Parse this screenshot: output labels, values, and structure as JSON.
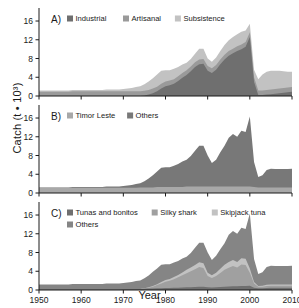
{
  "figure": {
    "axis": {
      "ylabel": "Catch (t • 10³)",
      "xlabel": "Year",
      "yticks": [
        0,
        4,
        8,
        12,
        16
      ],
      "xticks": [
        1950,
        1960,
        1970,
        1980,
        1990,
        2000,
        2010
      ],
      "ylim": [
        0,
        17.5
      ],
      "xlim": [
        1950,
        2010
      ]
    },
    "colors": {
      "dark": "#6f6f6f",
      "mid": "#8f8f8f",
      "light": "#b4b4b4",
      "lighter": "#c9c9c9",
      "axis": "#1a1a1a",
      "background": "#ffffff"
    },
    "panels": [
      {
        "id": "A)",
        "legend": [
          {
            "label": "Industrial",
            "color": "#6f6f6f"
          },
          {
            "label": "Artisanal",
            "color": "#9a9a9a"
          },
          {
            "label": "Subsistence",
            "color": "#c2c2c2"
          }
        ]
      },
      {
        "id": "B)",
        "legend": [
          {
            "label": "Timor Leste",
            "color": "#a8a8a8"
          },
          {
            "label": "Others",
            "color": "#787878"
          }
        ]
      },
      {
        "id": "C)",
        "legend": [
          {
            "label": "Tunas and bonitos",
            "color": "#6f6f6f"
          },
          {
            "label": "Silky shark",
            "color": "#a0a0a0"
          },
          {
            "label": "Skipjack tuna",
            "color": "#c2c2c2"
          },
          {
            "label": "Others",
            "color": "#858585"
          }
        ]
      }
    ]
  },
  "chart_data": [
    {
      "type": "area",
      "panel": "A)",
      "stacked": true,
      "title": "",
      "xlabel": "Year",
      "ylabel": "Catch (t • 10³)",
      "ylim": [
        0,
        17.5
      ],
      "xlim": [
        1950,
        2010
      ],
      "grid": false,
      "legend_position": "top",
      "x": [
        1950,
        1951,
        1952,
        1953,
        1954,
        1955,
        1956,
        1957,
        1958,
        1959,
        1960,
        1961,
        1962,
        1963,
        1964,
        1965,
        1966,
        1967,
        1968,
        1969,
        1970,
        1971,
        1972,
        1973,
        1974,
        1975,
        1976,
        1977,
        1978,
        1979,
        1980,
        1981,
        1982,
        1983,
        1984,
        1985,
        1986,
        1987,
        1988,
        1989,
        1990,
        1991,
        1992,
        1993,
        1994,
        1995,
        1996,
        1997,
        1998,
        1999,
        2000,
        2001,
        2002,
        2003,
        2004,
        2005,
        2006,
        2007,
        2008,
        2009,
        2010
      ],
      "series": [
        {
          "name": "Industrial",
          "values": [
            0,
            0,
            0,
            0,
            0,
            0,
            0,
            0,
            0,
            0,
            0,
            0,
            0,
            0,
            0,
            0,
            0,
            0,
            0,
            0,
            0,
            0,
            0,
            0,
            0,
            0.1,
            0.3,
            0.6,
            1.0,
            1.6,
            2.1,
            2.3,
            2.6,
            3.2,
            3.9,
            4.5,
            5.3,
            6.2,
            6.8,
            6.9,
            5.4,
            4.9,
            5.6,
            6.8,
            7.8,
            8.6,
            9.1,
            9.6,
            10.0,
            10.5,
            12.6,
            3.0,
            0.2,
            0.2,
            0.3,
            0.4,
            0.5,
            0.6,
            0.7,
            0.8,
            0.9
          ]
        },
        {
          "name": "Artisanal",
          "values": [
            0.9,
            0.9,
            0.9,
            0.9,
            0.9,
            0.9,
            0.9,
            0.9,
            1.0,
            1.0,
            1.0,
            1.0,
            1.0,
            1.0,
            1.0,
            1.0,
            1.0,
            1.0,
            1.0,
            1.0,
            1.0,
            1.0,
            1.0,
            1.0,
            1.0,
            1.0,
            1.0,
            1.0,
            1.0,
            1.0,
            1.0,
            1.0,
            1.0,
            1.0,
            1.0,
            1.0,
            1.0,
            1.0,
            1.0,
            1.0,
            1.0,
            1.0,
            1.0,
            1.0,
            1.0,
            1.0,
            1.0,
            1.0,
            1.0,
            1.0,
            1.0,
            1.0,
            1.0,
            1.0,
            1.0,
            1.0,
            1.0,
            1.0,
            1.0,
            1.0,
            1.0
          ]
        },
        {
          "name": "Subsistence",
          "values": [
            0.3,
            0.3,
            0.3,
            0.3,
            0.3,
            0.3,
            0.3,
            0.3,
            0.3,
            0.3,
            0.3,
            0.3,
            0.3,
            0.3,
            0.3,
            0.3,
            0.4,
            0.4,
            0.4,
            0.4,
            0.5,
            0.6,
            0.7,
            0.9,
            1.1,
            1.4,
            1.8,
            2.2,
            2.6,
            2.8,
            2.4,
            2.2,
            2.2,
            2.0,
            1.8,
            1.6,
            1.6,
            1.8,
            2.3,
            2.2,
            1.6,
            1.4,
            1.6,
            1.8,
            2.1,
            2.3,
            2.5,
            2.6,
            2.7,
            2.5,
            1.8,
            1.6,
            2.4,
            3.4,
            3.9,
            4.0,
            3.9,
            3.8,
            3.6,
            3.4,
            3.3
          ]
        }
      ]
    },
    {
      "type": "area",
      "panel": "B)",
      "stacked": true,
      "title": "",
      "xlabel": "Year",
      "ylabel": "Catch (t • 10³)",
      "ylim": [
        0,
        17.5
      ],
      "xlim": [
        1950,
        2010
      ],
      "grid": false,
      "legend_position": "top",
      "x": [
        1950,
        1951,
        1952,
        1953,
        1954,
        1955,
        1956,
        1957,
        1958,
        1959,
        1960,
        1961,
        1962,
        1963,
        1964,
        1965,
        1966,
        1967,
        1968,
        1969,
        1970,
        1971,
        1972,
        1973,
        1974,
        1975,
        1976,
        1977,
        1978,
        1979,
        1980,
        1981,
        1982,
        1983,
        1984,
        1985,
        1986,
        1987,
        1988,
        1989,
        1990,
        1991,
        1992,
        1993,
        1994,
        1995,
        1996,
        1997,
        1998,
        1999,
        2000,
        2001,
        2002,
        2003,
        2004,
        2005,
        2006,
        2007,
        2008,
        2009,
        2010
      ],
      "series": [
        {
          "name": "Timor Leste",
          "values": [
            1.1,
            1.1,
            1.1,
            1.1,
            1.1,
            1.1,
            1.1,
            1.1,
            1.1,
            1.1,
            1.1,
            1.1,
            1.1,
            1.1,
            1.1,
            1.1,
            1.1,
            1.1,
            1.1,
            1.1,
            1.1,
            1.1,
            1.1,
            1.1,
            1.2,
            1.2,
            1.2,
            1.2,
            1.3,
            1.3,
            1.3,
            1.3,
            1.3,
            1.3,
            1.3,
            1.4,
            1.4,
            1.4,
            1.4,
            1.4,
            1.4,
            1.4,
            1.4,
            1.4,
            1.4,
            1.4,
            1.4,
            1.4,
            1.4,
            1.4,
            1.4,
            1.3,
            1.2,
            1.2,
            1.2,
            1.2,
            1.2,
            1.2,
            1.2,
            1.2,
            1.2
          ]
        },
        {
          "name": "Others",
          "values": [
            0.1,
            0.1,
            0.1,
            0.1,
            0.1,
            0.1,
            0.1,
            0.1,
            0.2,
            0.2,
            0.2,
            0.2,
            0.2,
            0.2,
            0.2,
            0.2,
            0.3,
            0.3,
            0.3,
            0.3,
            0.4,
            0.5,
            0.6,
            0.8,
            0.9,
            1.3,
            1.9,
            2.6,
            3.3,
            4.1,
            4.2,
            4.2,
            4.5,
            4.9,
            5.4,
            5.7,
            6.5,
            7.6,
            8.7,
            8.7,
            6.6,
            5.0,
            5.7,
            7.3,
            8.7,
            10.4,
            11.2,
            10.6,
            11.9,
            11.6,
            14.9,
            5.3,
            2.2,
            2.6,
            3.7,
            4.0,
            3.9,
            3.9,
            3.9,
            3.9,
            4.0
          ]
        }
      ]
    },
    {
      "type": "area",
      "panel": "C)",
      "stacked": true,
      "title": "",
      "xlabel": "Year",
      "ylabel": "Catch (t • 10³)",
      "ylim": [
        0,
        17.5
      ],
      "xlim": [
        1950,
        2010
      ],
      "grid": false,
      "legend_position": "top",
      "x": [
        1950,
        1951,
        1952,
        1953,
        1954,
        1955,
        1956,
        1957,
        1958,
        1959,
        1960,
        1961,
        1962,
        1963,
        1964,
        1965,
        1966,
        1967,
        1968,
        1969,
        1970,
        1971,
        1972,
        1973,
        1974,
        1975,
        1976,
        1977,
        1978,
        1979,
        1980,
        1981,
        1982,
        1983,
        1984,
        1985,
        1986,
        1987,
        1988,
        1989,
        1990,
        1991,
        1992,
        1993,
        1994,
        1995,
        1996,
        1997,
        1998,
        1999,
        2000,
        2001,
        2002,
        2003,
        2004,
        2005,
        2006,
        2007,
        2008,
        2009,
        2010
      ],
      "series": [
        {
          "name": "Tunas and bonitos",
          "values": [
            0.15,
            0.15,
            0.15,
            0.15,
            0.15,
            0.15,
            0.15,
            0.15,
            0.15,
            0.15,
            0.15,
            0.15,
            0.15,
            0.15,
            0.15,
            0.15,
            0.15,
            0.15,
            0.15,
            0.15,
            0.2,
            0.2,
            0.2,
            0.2,
            0.2,
            0.25,
            0.3,
            0.3,
            0.35,
            0.4,
            0.45,
            0.45,
            0.5,
            0.5,
            0.55,
            0.6,
            0.6,
            0.65,
            0.7,
            0.7,
            0.6,
            0.55,
            0.6,
            0.65,
            0.7,
            0.75,
            0.8,
            0.8,
            0.85,
            0.85,
            0.9,
            0.5,
            0.4,
            0.4,
            0.45,
            0.5,
            0.5,
            0.5,
            0.5,
            0.5,
            0.5
          ]
        },
        {
          "name": "Silky shark",
          "values": [
            0,
            0,
            0,
            0,
            0,
            0,
            0,
            0,
            0,
            0,
            0,
            0,
            0,
            0,
            0,
            0,
            0,
            0,
            0,
            0,
            0,
            0,
            0,
            0,
            0,
            0.1,
            0.2,
            0.4,
            0.7,
            1.0,
            1.3,
            1.5,
            1.8,
            2.2,
            2.6,
            3.0,
            3.4,
            3.8,
            4.2,
            4.0,
            2.4,
            2.0,
            2.4,
            3.0,
            3.6,
            4.0,
            4.3,
            4.0,
            4.6,
            4.5,
            2.8,
            0.9,
            0.3,
            0.3,
            0.4,
            0.4,
            0.4,
            0.4,
            0.4,
            0.4,
            0.4
          ]
        },
        {
          "name": "Skipjack tuna",
          "values": [
            0,
            0,
            0,
            0,
            0,
            0,
            0,
            0,
            0,
            0,
            0,
            0,
            0,
            0,
            0,
            0,
            0,
            0,
            0,
            0,
            0,
            0,
            0,
            0,
            0,
            0.05,
            0.1,
            0.15,
            0.2,
            0.3,
            0.4,
            0.4,
            0.45,
            0.5,
            0.6,
            0.7,
            0.8,
            0.9,
            1.0,
            1.0,
            0.7,
            0.6,
            0.7,
            0.9,
            1.1,
            1.2,
            1.3,
            1.2,
            1.3,
            1.3,
            0.9,
            0.3,
            0.15,
            0.2,
            0.25,
            0.3,
            0.3,
            0.3,
            0.3,
            0.3,
            0.3
          ]
        },
        {
          "name": "Others",
          "values": [
            1.05,
            1.05,
            1.05,
            1.05,
            1.05,
            1.05,
            1.05,
            1.05,
            1.15,
            1.15,
            1.15,
            1.15,
            1.15,
            1.15,
            1.15,
            1.15,
            1.25,
            1.25,
            1.25,
            1.25,
            1.3,
            1.4,
            1.5,
            1.7,
            1.85,
            2.1,
            2.5,
            3.05,
            3.35,
            3.7,
            3.35,
            3.15,
            3.1,
            3.0,
            2.95,
            2.8,
            3.1,
            3.65,
            4.2,
            4.4,
            4.3,
            3.25,
            3.6,
            4.15,
            4.6,
            5.85,
            6.2,
            6.0,
            6.55,
            6.35,
            11.7,
            4.9,
            2.55,
            2.9,
            3.8,
            4.0,
            3.9,
            3.9,
            3.9,
            3.9,
            4.0
          ]
        }
      ]
    }
  ]
}
